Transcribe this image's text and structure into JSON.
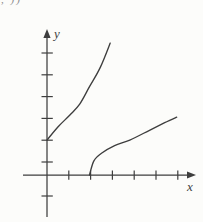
{
  "figure": {
    "corner_fragment": ", ))",
    "background": "#fcfcfa",
    "ink_color": "#3e3e3e",
    "label_color": "#3f3f3f",
    "fragment_color": "#8a8a8a"
  },
  "chart_data": {
    "type": "line",
    "title": "",
    "xlabel": "x",
    "ylabel": "y",
    "grid": false,
    "legend": false,
    "tick_labels_shown": false,
    "x_ticks": [
      1,
      2,
      3,
      4,
      5,
      6
    ],
    "y_ticks_above_axis": [
      1,
      2,
      3,
      4,
      5,
      6
    ],
    "y_ticks_below_axis": [
      -1
    ],
    "xlim": [
      -1.1,
      6.9
    ],
    "ylim": [
      -2.1,
      6.7
    ],
    "series": [
      {
        "name": "exponential-curve",
        "description": "increasing concave-up curve starting on the y-axis at the second tick",
        "points": [
          [
            0,
            1.6
          ],
          [
            0.5,
            2.2
          ],
          [
            1.05,
            2.75
          ],
          [
            1.5,
            3.25
          ],
          [
            1.95,
            4.05
          ],
          [
            2.45,
            4.95
          ],
          [
            2.9,
            6.05
          ]
        ]
      },
      {
        "name": "inverse-log-curve",
        "description": "increasing concave-down curve starting on the x-axis at the second tick",
        "points": [
          [
            1.95,
            0
          ],
          [
            2.15,
            0.65
          ],
          [
            2.5,
            1.0
          ],
          [
            3.1,
            1.35
          ],
          [
            3.8,
            1.6
          ],
          [
            4.7,
            2.05
          ],
          [
            5.4,
            2.4
          ],
          [
            5.95,
            2.65
          ]
        ]
      }
    ]
  }
}
